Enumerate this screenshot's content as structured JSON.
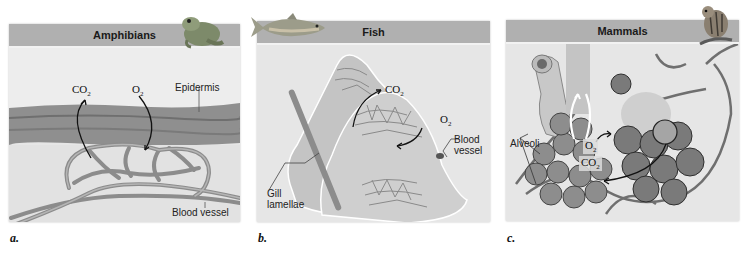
{
  "panels": [
    {
      "letter": "a.",
      "title": "Amphibians",
      "animal_icon": "frog-icon",
      "labels": {
        "epidermis": "Epidermis",
        "blood_vessel": "Blood vessel"
      },
      "gases": {
        "co2": "CO",
        "co2_sub": "2",
        "o2": "O",
        "o2_sub": "2"
      }
    },
    {
      "letter": "b.",
      "title": "Fish",
      "animal_icon": "fish-icon",
      "labels": {
        "gill_line1": "Gill",
        "gill_line2": "lamellae",
        "blood_line1": "Blood",
        "blood_line2": "vessel"
      },
      "gases": {
        "co2": "CO",
        "co2_sub": "2",
        "o2": "O",
        "o2_sub": "2"
      }
    },
    {
      "letter": "c.",
      "title": "Mammals",
      "animal_icon": "chipmunk-icon",
      "labels": {
        "alveoli": "Alveoli"
      },
      "gases": {
        "co2": "CO",
        "co2_sub": "2",
        "o2": "O",
        "o2_sub": "2"
      }
    }
  ],
  "colors": {
    "header": "#b0b0b0",
    "panel_bg": "#e6e6e6",
    "epidermis": "#8a8a8a",
    "vessel": "#9a9a9a"
  }
}
